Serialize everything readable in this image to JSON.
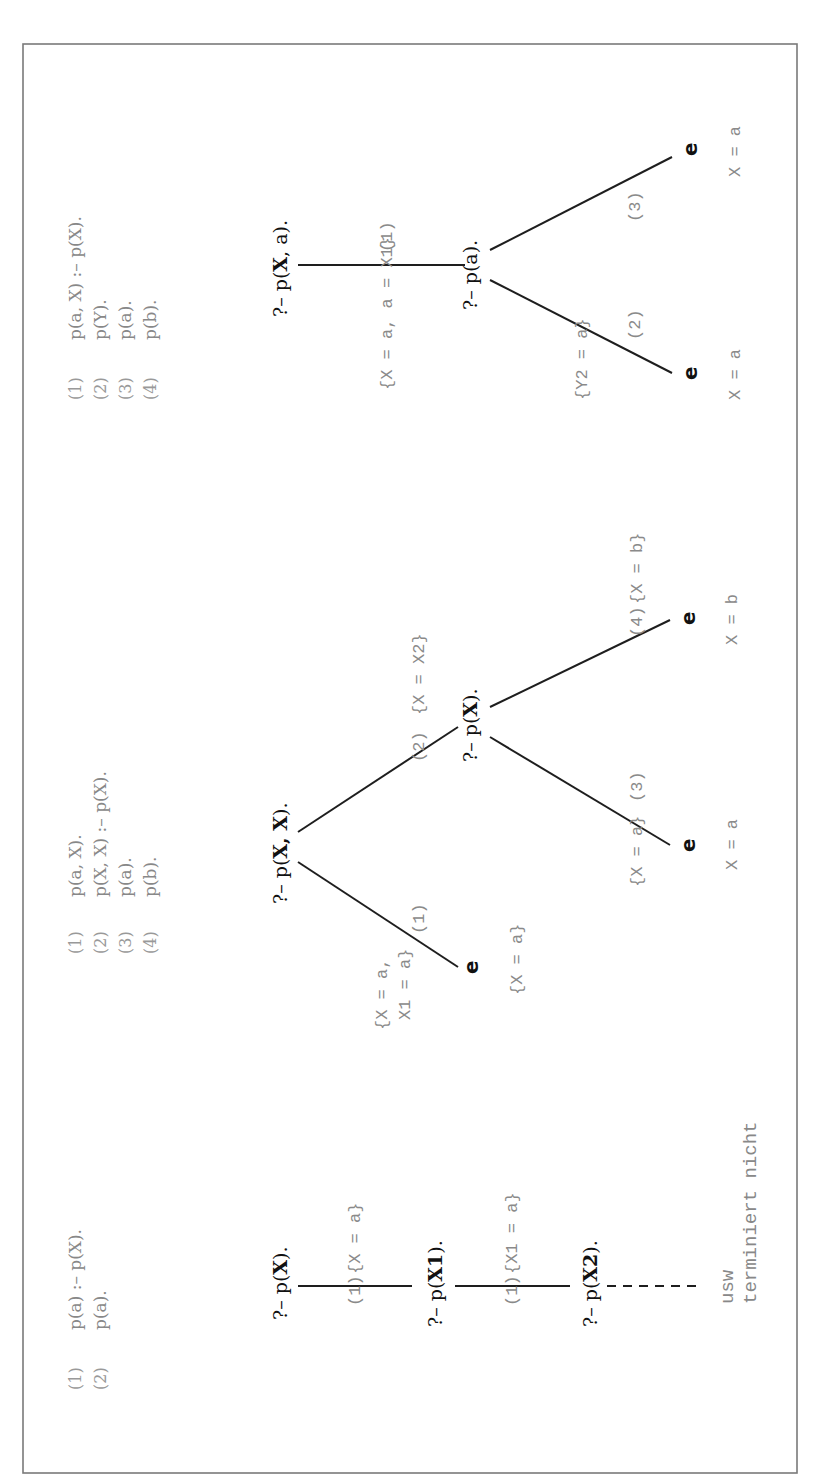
{
  "frame": {
    "stroke": "#7a7a7a"
  },
  "panels": [
    {
      "program": [
        {
          "num": "(1)",
          "clause": "p(a) :– p(X)."
        },
        {
          "num": "(2)",
          "clause": "p(a)."
        }
      ],
      "nodes": {
        "n0": {
          "prefix": "?– p(",
          "arg": "X",
          "suffix": ")."
        },
        "n1": {
          "prefix": "?– p(",
          "arg": "X1",
          "suffix": ")."
        },
        "n2": {
          "prefix": "?– p(",
          "arg": "X2",
          "suffix": ")."
        }
      },
      "edges": [
        {
          "rule": "(1)",
          "subst": "{X = a}"
        },
        {
          "rule": "(1)",
          "subst": "{X1 = a}"
        }
      ],
      "note": {
        "line1": "usw",
        "line2": "terminiert nicht"
      }
    },
    {
      "program": [
        {
          "num": "(1)",
          "clause": "p(a, X)."
        },
        {
          "num": "(2)",
          "clause": "p(X, X) :– p(X)."
        },
        {
          "num": "(3)",
          "clause": "p(a)."
        },
        {
          "num": "(4)",
          "clause": "p(b)."
        }
      ],
      "nodes": {
        "root": {
          "prefix": "?– p(",
          "arg": "X, X",
          "suffix": ")."
        },
        "inner": {
          "prefix": "?– p(",
          "arg": "X",
          "suffix": ")."
        }
      },
      "edges": [
        {
          "rule": "(1)",
          "subst_line1": "{X = a,",
          "subst_line2": "X1 = a}"
        },
        {
          "rule": "(2)",
          "subst": "{X = X2}"
        },
        {
          "rule": "(3)",
          "subst": "{X = a}"
        },
        {
          "rule": "(4)",
          "subst": "{X = b}"
        }
      ],
      "leaves": [
        {
          "label": "e",
          "answer": "{X = a}"
        },
        {
          "label": "e",
          "answer": "X = a"
        },
        {
          "label": "e",
          "answer": "X = b"
        }
      ]
    },
    {
      "program": [
        {
          "num": "(1)",
          "clause": "p(a, X) :– p(X)."
        },
        {
          "num": "(2)",
          "clause": "p(Y)."
        },
        {
          "num": "(3)",
          "clause": "p(a)."
        },
        {
          "num": "(4)",
          "clause": "p(b)."
        }
      ],
      "nodes": {
        "root": {
          "prefix": "?– p(",
          "arg": "X",
          "mid": ", a",
          "suffix": ")."
        },
        "inner": {
          "text": "?– p(a)."
        }
      },
      "edges": [
        {
          "rule": "(1)",
          "subst": "{X = a, a = X1}"
        },
        {
          "rule": "(2)",
          "subst": "{Y2 = a}"
        },
        {
          "rule": "(3)",
          "subst": ""
        }
      ],
      "leaves": [
        {
          "label": "e",
          "answer": "X = a"
        },
        {
          "label": "e",
          "answer": "X = a"
        }
      ]
    }
  ]
}
